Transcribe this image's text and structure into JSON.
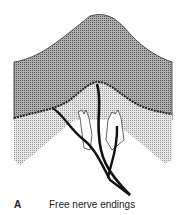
{
  "figure": {
    "panel_letter": "A",
    "caption": "Free nerve endings",
    "colors": {
      "epidermis": "#8a8a8a",
      "dermis": "#cfcfcf",
      "nerve": "#111111",
      "background": "#ffffff"
    }
  }
}
